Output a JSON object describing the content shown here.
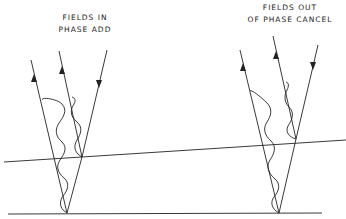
{
  "diagram": {
    "left_group": {
      "label_line1": "FIELDS IN",
      "label_line2": "PHASE ADD"
    },
    "right_group": {
      "label_line1": "FIELDS OUT",
      "label_line2": "OF PHASE CANCEL"
    },
    "colors": {
      "ink": "#222222",
      "background": "#ffffff"
    }
  }
}
